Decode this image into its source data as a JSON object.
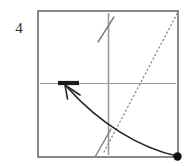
{
  "figure": {
    "panel_label": "4",
    "caption_alt": "Phase-plane style sketch: axes cross inside a square frame, a dotted rising diagonal, two short dashed slanted tick segments, a bold horizontal segment on the horizontal axis, and a curved arrow from a filled dot at the lower right to the bold segment.",
    "colors": {
      "frame": "#6b6b6b",
      "axis": "#9a9a9a",
      "dotted_line": "#8a8a8a",
      "dashed_mark": "#7d7d7d",
      "bold_segment": "#1a1a1a",
      "trajectory": "#262626",
      "dot": "#111111",
      "label_text": "#2b2b2b",
      "background": "#ffffff"
    },
    "frame": {
      "name": "plot-frame",
      "x_left": 38,
      "y_top": 11,
      "x_right": 178,
      "y_bottom": 157,
      "stroke_width": 1.6
    },
    "axes": {
      "horizontal": {
        "name": "horizontal-axis",
        "x1": 40,
        "y1": 83.5,
        "x2": 176,
        "y2": 83.5
      },
      "vertical": {
        "name": "vertical-axis",
        "x1": 108.5,
        "y1": 13,
        "x2": 108.5,
        "y2": 155
      }
    },
    "dotted_diagonal": {
      "name": "dotted-diagonal-line",
      "x1": 104,
      "y1": 152,
      "x2": 178,
      "y2": 12,
      "dash_pattern": "1.2 3.0",
      "stroke_width": 1.3
    },
    "dashed_marks": [
      {
        "name": "dashed-mark-upper",
        "x1": 98,
        "y1": 42,
        "x2": 114,
        "y2": 17
      },
      {
        "name": "dashed-mark-lower",
        "x1": 95,
        "y1": 157,
        "x2": 111,
        "y2": 129
      }
    ],
    "bold_segment": {
      "name": "bold-horizontal-segment",
      "x1": 58,
      "y1": 83,
      "x2": 79,
      "y2": 83,
      "stroke_width": 4.2
    },
    "trajectory": {
      "name": "trajectory-curve",
      "start_x": 177,
      "start_y": 156,
      "control1_x": 140,
      "control1_y": 148,
      "control2_x": 100,
      "control2_y": 124,
      "end_x": 67,
      "end_y": 87,
      "stroke_width": 1.7
    },
    "arrowhead": {
      "name": "trajectory-arrowhead",
      "tip_x": 65,
      "tip_y": 85,
      "barb_left_x": 67.5,
      "barb_left_y": 99,
      "barb_right_x": 80,
      "barb_right_y": 95,
      "stroke_width": 1.6
    },
    "endpoint_dot": {
      "name": "initial-condition-dot",
      "cx": 177.5,
      "cy": 156.5,
      "r": 4.2
    }
  }
}
